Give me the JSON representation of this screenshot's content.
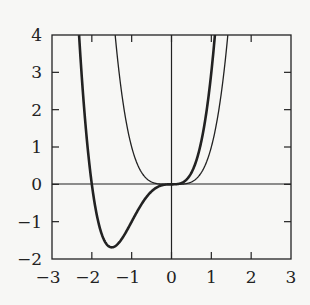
{
  "chart_data": {
    "type": "line",
    "title": "",
    "xlabel": "",
    "ylabel": "",
    "xlim": [
      -3,
      3
    ],
    "ylim": [
      -2,
      4
    ],
    "grid": false,
    "legend": null,
    "x_ticks": [
      -3,
      -2,
      -1,
      0,
      1,
      2,
      3
    ],
    "y_ticks": [
      -2,
      -1,
      0,
      1,
      2,
      3,
      4
    ],
    "x_tick_labels": [
      "−3",
      "−2",
      "−1",
      "0",
      "1",
      "2",
      "3"
    ],
    "y_tick_labels": [
      "−2",
      "−1",
      "0",
      "1",
      "2",
      "3",
      "4"
    ],
    "axes_lines": {
      "x_axis_at_y": 0,
      "y_axis_at_x": 0
    },
    "series": [
      {
        "name": "x^4",
        "style": "thin",
        "color": "#222222",
        "x": [
          -1.414,
          -1.25,
          -1.0,
          -0.75,
          -0.5,
          -0.25,
          0,
          0.25,
          0.5,
          0.75,
          1.0,
          1.25,
          1.414
        ],
        "y": [
          4.0,
          2.44,
          1.0,
          0.32,
          0.06,
          0.0,
          0.0,
          0.0,
          0.06,
          0.32,
          1.0,
          2.44,
          4.0
        ]
      },
      {
        "name": "x^4 + 2x^3",
        "style": "thick",
        "color": "#222222",
        "x": [
          -2.32,
          -2.25,
          -2.0,
          -1.75,
          -1.5,
          -1.25,
          -1.0,
          -0.75,
          -0.5,
          -0.25,
          0,
          0.25,
          0.5,
          0.75,
          1.0,
          1.09
        ],
        "y": [
          4.0,
          2.78,
          0.0,
          -1.34,
          -1.69,
          -1.46,
          -1.0,
          -0.53,
          -0.19,
          -0.027,
          0.0,
          0.035,
          0.31,
          1.16,
          3.0,
          4.0
        ]
      }
    ]
  }
}
